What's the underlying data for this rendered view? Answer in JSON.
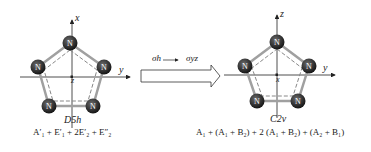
{
  "left_molecule": {
    "axis_vertical": "x",
    "axis_horizontal": "y",
    "axis_center": "z",
    "atoms": [
      "N",
      "N",
      "N",
      "N",
      "N"
    ],
    "point_group": "D5h",
    "representation": "A′₁ + E′₁ + 2E′₂ + E″₂"
  },
  "transition": {
    "from": "σh",
    "to": "σyz"
  },
  "right_molecule": {
    "axis_vertical": "z",
    "axis_horizontal": "y",
    "axis_center": "x",
    "atoms": [
      "N",
      "N",
      "N",
      "N",
      "N"
    ],
    "point_group": "C2v",
    "representation": "A₁ + (A₁ + B₂) + 2 (A₁ + B₂) + (A₂ + B₁)"
  },
  "colors": {
    "atom": "#2b2b2b",
    "bond": "#9a9a9a",
    "axis": "#222222"
  }
}
